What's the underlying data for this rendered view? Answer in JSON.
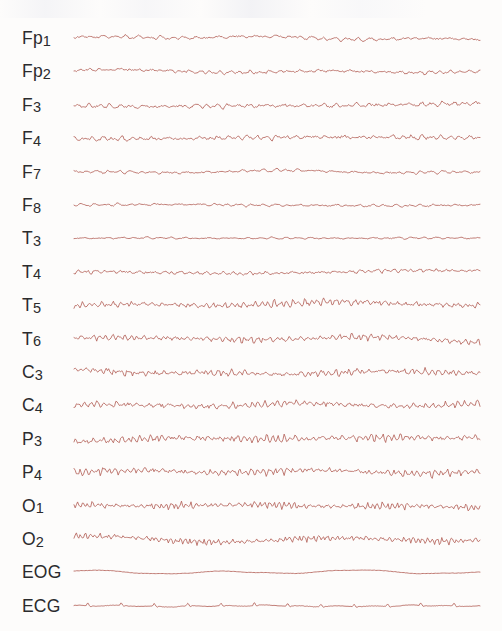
{
  "recording": {
    "title": "EEG Recording",
    "trace_color": "#b5645c",
    "label_color": "#2b2b2d",
    "background_color": "#fdfcfb",
    "channel_count": 18,
    "row_spacing_px": 33.4,
    "first_row_y_px": 21,
    "trace_left_px": 74,
    "trace_right_px": 480
  },
  "channels": [
    {
      "label": "Fp1",
      "name_base": "Fp",
      "name_num": "1",
      "type": "eeg",
      "region": "frontopolar-left",
      "amplitude": 3.4,
      "frequency": 1.25,
      "roughness": 0.55,
      "seed": 11
    },
    {
      "label": "Fp2",
      "name_base": "Fp",
      "name_num": "2",
      "type": "eeg",
      "region": "frontopolar-right",
      "amplitude": 3.1,
      "frequency": 1.45,
      "roughness": 0.7,
      "seed": 23
    },
    {
      "label": "F3",
      "name_base": "F",
      "name_num": "3",
      "type": "eeg",
      "region": "frontal-left",
      "amplitude": 4.1,
      "frequency": 1.35,
      "roughness": 0.65,
      "seed": 37
    },
    {
      "label": "F4",
      "name_base": "F",
      "name_num": "4",
      "type": "eeg",
      "region": "frontal-right",
      "amplitude": 4.0,
      "frequency": 1.5,
      "roughness": 0.7,
      "seed": 52
    },
    {
      "label": "F7",
      "name_base": "F",
      "name_num": "7",
      "type": "eeg",
      "region": "frontotemporal-left",
      "amplitude": 3.0,
      "frequency": 1.3,
      "roughness": 0.5,
      "seed": 64
    },
    {
      "label": "F8",
      "name_base": "F",
      "name_num": "8",
      "type": "eeg",
      "region": "frontotemporal-right",
      "amplitude": 2.6,
      "frequency": 1.2,
      "roughness": 0.5,
      "seed": 79
    },
    {
      "label": "T3",
      "name_base": "T",
      "name_num": "3",
      "type": "eeg",
      "region": "temporal-left",
      "amplitude": 2.0,
      "frequency": 1.15,
      "roughness": 0.45,
      "seed": 91
    },
    {
      "label": "T4",
      "name_base": "T",
      "name_num": "4",
      "type": "eeg",
      "region": "temporal-right",
      "amplitude": 3.2,
      "frequency": 1.7,
      "roughness": 0.7,
      "seed": 105
    },
    {
      "label": "T5",
      "name_base": "T",
      "name_num": "5",
      "type": "eeg",
      "region": "posterior-temporal-left",
      "amplitude": 6.4,
      "frequency": 2.35,
      "roughness": 0.55,
      "seed": 118
    },
    {
      "label": "T6",
      "name_base": "T",
      "name_num": "6",
      "type": "eeg",
      "region": "posterior-temporal-right",
      "amplitude": 5.8,
      "frequency": 2.3,
      "roughness": 0.5,
      "seed": 133
    },
    {
      "label": "C3",
      "name_base": "C",
      "name_num": "3",
      "type": "eeg",
      "region": "central-left",
      "amplitude": 5.6,
      "frequency": 2.1,
      "roughness": 0.7,
      "seed": 147
    },
    {
      "label": "C4",
      "name_base": "C",
      "name_num": "4",
      "type": "eeg",
      "region": "central-right",
      "amplitude": 5.2,
      "frequency": 2.25,
      "roughness": 0.7,
      "seed": 161
    },
    {
      "label": "P3",
      "name_base": "P",
      "name_num": "3",
      "type": "eeg",
      "region": "parietal-left",
      "amplitude": 6.6,
      "frequency": 2.5,
      "roughness": 0.55,
      "seed": 176
    },
    {
      "label": "P4",
      "name_base": "P",
      "name_num": "4",
      "type": "eeg",
      "region": "parietal-right",
      "amplitude": 6.2,
      "frequency": 2.45,
      "roughness": 0.6,
      "seed": 190
    },
    {
      "label": "O1",
      "name_base": "O",
      "name_num": "1",
      "type": "eeg",
      "region": "occipital-left",
      "amplitude": 6.3,
      "frequency": 2.95,
      "roughness": 0.45,
      "seed": 204
    },
    {
      "label": "O2",
      "name_base": "O",
      "name_num": "2",
      "type": "eeg",
      "region": "occipital-right",
      "amplitude": 6.1,
      "frequency": 3.05,
      "roughness": 0.45,
      "seed": 219
    },
    {
      "label": "EOG",
      "name_base": "EOG",
      "name_num": "",
      "type": "eog",
      "region": "eye-movement",
      "amplitude": 2.4,
      "frequency": 0.42,
      "roughness": 0.22,
      "seed": 233
    },
    {
      "label": "ECG",
      "name_base": "ECG",
      "name_num": "",
      "type": "ecg",
      "region": "cardiac",
      "amplitude": 2.2,
      "frequency": 0.9,
      "roughness": 0.3,
      "seed": 248
    }
  ]
}
